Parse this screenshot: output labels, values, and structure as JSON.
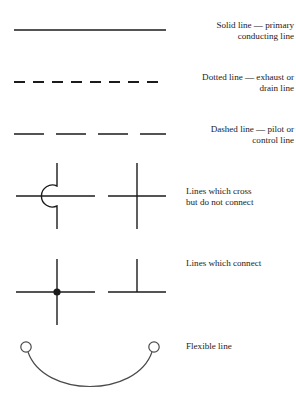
{
  "figure": {
    "background_color": "#ffffff",
    "line_color": "#1b1b1b",
    "text_color": "#1b1b1b"
  },
  "rows": [
    {
      "id": "solid-line",
      "symbol": "solid-line-symbol",
      "label": "Solid line — primary\nconducting line",
      "align": "right"
    },
    {
      "id": "dotted-line",
      "symbol": "dotted-line-symbol",
      "label": "Dotted line — exhaust or\ndrain line",
      "align": "right"
    },
    {
      "id": "dashed-line",
      "symbol": "dashed-line-symbol",
      "label": "Dashed line — pilot or\ncontrol line",
      "align": "right"
    },
    {
      "id": "lines-cross",
      "symbol": "crossing-lines-symbol",
      "label": "Lines which cross\nbut do not connect",
      "align": "left"
    },
    {
      "id": "lines-connect",
      "symbol": "connecting-lines-symbol",
      "label": "Lines which connect",
      "align": "left"
    },
    {
      "id": "flexible-line",
      "symbol": "flexible-line-symbol",
      "label": "Flexible line",
      "align": "left"
    }
  ]
}
